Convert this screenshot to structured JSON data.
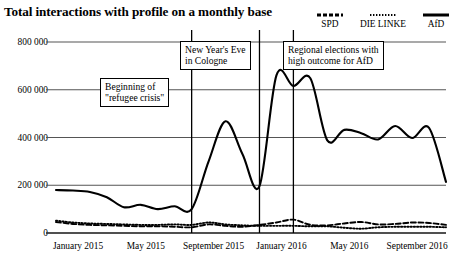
{
  "header": {
    "title": "Total interactions with profile on a monthly base"
  },
  "legend": {
    "position": "top-right",
    "items": [
      {
        "label": "SPD",
        "style": "dashed",
        "icon": "dashed-line-icon"
      },
      {
        "label": "DIE LINKE",
        "style": "dotted",
        "icon": "dotted-line-icon"
      },
      {
        "label": "AfD",
        "style": "solid",
        "icon": "solid-line-icon"
      }
    ]
  },
  "axes": {
    "y_ticks": [
      "0",
      "200 000",
      "400 000",
      "600 000",
      "800 000"
    ],
    "x_ticks": [
      "January 2015",
      "May 2015",
      "September 2015",
      "January 2016",
      "May 2016",
      "September 2016"
    ]
  },
  "annotations": [
    {
      "text": "Beginning of\n\"refugee crisis\"",
      "marker_month": "2015-09"
    },
    {
      "text": "New Year's Eve\nin Cologne",
      "marker_month": "2016-01"
    },
    {
      "text": "Regional elections with\nhigh outcome for AfD",
      "marker_month": "2016-03"
    }
  ],
  "colors": {
    "line": "#000000",
    "grid": "#555555",
    "background": "#ffffff"
  },
  "chart_data": {
    "type": "line",
    "title": "Total interactions with profile on a monthly base",
    "xlabel": "",
    "ylabel": "",
    "ylim": [
      0,
      800000
    ],
    "ytick_values": [
      0,
      200000,
      400000,
      600000,
      800000
    ],
    "grid": true,
    "legend_position": "top-right",
    "x": [
      "January 2015",
      "February 2015",
      "March 2015",
      "April 2015",
      "May 2015",
      "June 2015",
      "July 2015",
      "August 2015",
      "September 2015",
      "October 2015",
      "November 2015",
      "December 2015",
      "January 2016",
      "February 2016",
      "March 2016",
      "April 2016",
      "May 2016",
      "June 2016",
      "July 2016",
      "August 2016",
      "September 2016",
      "October 2016",
      "November 2016",
      "December 2016"
    ],
    "series": [
      {
        "name": "AfD",
        "style": "solid",
        "values": [
          180000,
          178000,
          172000,
          150000,
          108000,
          118000,
          100000,
          112000,
          100000,
          300000,
          468000,
          330000,
          196000,
          660000,
          616000,
          648000,
          388000,
          432000,
          418000,
          392000,
          448000,
          398000,
          440000,
          214000
        ]
      },
      {
        "name": "SPD",
        "style": "dashed",
        "values": [
          46000,
          38000,
          34000,
          32000,
          30000,
          28000,
          28000,
          26000,
          24000,
          36000,
          30000,
          26000,
          34000,
          44000,
          56000,
          34000,
          32000,
          40000,
          46000,
          36000,
          38000,
          44000,
          42000,
          34000
        ]
      },
      {
        "name": "DIE LINKE",
        "style": "dotted",
        "values": [
          52000,
          44000,
          40000,
          38000,
          36000,
          34000,
          34000,
          36000,
          34000,
          44000,
          36000,
          32000,
          30000,
          30000,
          30000,
          28000,
          28000,
          22000,
          18000,
          24000,
          26000,
          26000,
          26000,
          24000
        ]
      }
    ]
  }
}
